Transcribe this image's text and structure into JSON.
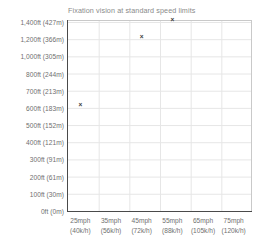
{
  "chart_data": {
    "type": "scatter",
    "title": "Fixation vision at standard speed limits",
    "xlabel": "",
    "ylabel": "",
    "grid": true,
    "legend": "none",
    "marker": "x",
    "marker_color": "#3a3a3a",
    "grid_color": "#e6e6e6",
    "axis_color": "#4a4a4a",
    "text_color": "#6f6f6f",
    "title_color": "#8a8a8a",
    "background": "#ffffff",
    "categories": [
      "25mph (40k/h)",
      "35mph (56k/h)",
      "45mph (72k/h)",
      "55mph (88k/h)",
      "65mph (105k/h)",
      "75mph (120k/h)"
    ],
    "x_tick_labels": [
      {
        "line1": "25mph",
        "line2": "(40k/h)"
      },
      {
        "line1": "35mph",
        "line2": "(56k/h)"
      },
      {
        "line1": "45mph",
        "line2": "(72k/h)"
      },
      {
        "line1": "55mph",
        "line2": "(88k/h)"
      },
      {
        "line1": "65mph",
        "line2": "(105k/h)"
      },
      {
        "line1": "75mph",
        "line2": "(120k/h)"
      }
    ],
    "y_tick_labels": [
      "1,400ft (427m)",
      "1,200ft (366m)",
      "1,000ft (305m)",
      "800ft (244m)",
      "700ft (213m)",
      "600ft (183m)",
      "500ft (152m)",
      "400ft (121m)",
      "300ft (91m)",
      "200ft (61m)",
      "100ft (30m)",
      "0ft (0m)"
    ],
    "y_tick_values_ft": [
      1400,
      1200,
      1000,
      800,
      700,
      600,
      500,
      400,
      300,
      200,
      100,
      0
    ],
    "y_tick_values_m": [
      427,
      366,
      305,
      244,
      213,
      183,
      152,
      121,
      91,
      61,
      30,
      0
    ],
    "ylim": [
      0,
      1400
    ],
    "points": [
      {
        "x_label": "25mph (40k/h)",
        "speed_mph": 25,
        "speed_kph": 40,
        "y_ft": 600,
        "y_m": 183
      },
      {
        "x_label": "45mph (72k/h)",
        "speed_mph": 45,
        "speed_kph": 72,
        "y_ft": 1200,
        "y_m": 366
      },
      {
        "x_label": "55mph (88k/h)",
        "speed_mph": 55,
        "speed_kph": 88,
        "y_ft": 1400,
        "y_m": 427
      }
    ],
    "marker_glyph": "×"
  }
}
